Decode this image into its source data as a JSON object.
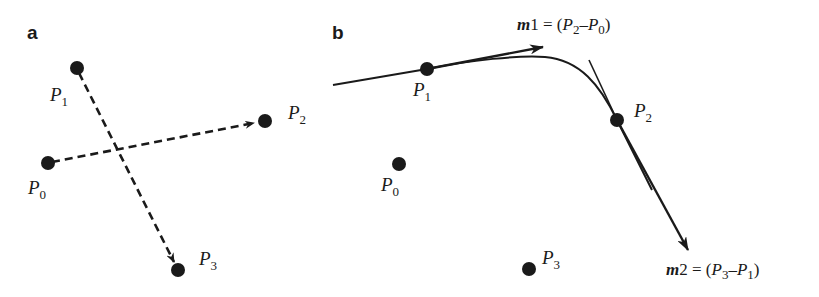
{
  "panels": [
    {
      "label": "a",
      "points": [
        {
          "name": "P",
          "sub": "0",
          "x": 48,
          "y": 163
        },
        {
          "name": "P",
          "sub": "1",
          "x": 77,
          "y": 68
        },
        {
          "name": "P",
          "sub": "2",
          "x": 265,
          "y": 121
        },
        {
          "name": "P",
          "sub": "3",
          "x": 178,
          "y": 270
        }
      ],
      "arrows": [
        {
          "from": "P0",
          "to": "P2",
          "style": "dashed"
        },
        {
          "from": "P1",
          "to": "P3",
          "style": "dashed"
        }
      ]
    },
    {
      "label": "b",
      "points": [
        {
          "name": "P",
          "sub": "0",
          "x": 399,
          "y": 164
        },
        {
          "name": "P",
          "sub": "1",
          "x": 427,
          "y": 69
        },
        {
          "name": "P",
          "sub": "2",
          "x": 617,
          "y": 120
        },
        {
          "name": "P",
          "sub": "3",
          "x": 529,
          "y": 269
        }
      ],
      "tangents": [
        {
          "name": "m1",
          "text_prefix": "m",
          "text_num": "1",
          "eq": " = (",
          "a": "P",
          "a_sub": "2",
          "minus": "–",
          "b": "P",
          "b_sub": "0",
          "close": ")"
        },
        {
          "name": "m2",
          "text_prefix": "m",
          "text_num": "2",
          "eq": " = (",
          "a": "P",
          "a_sub": "3",
          "minus": "–",
          "b": "P",
          "b_sub": "1",
          "close": ")"
        }
      ]
    }
  ]
}
